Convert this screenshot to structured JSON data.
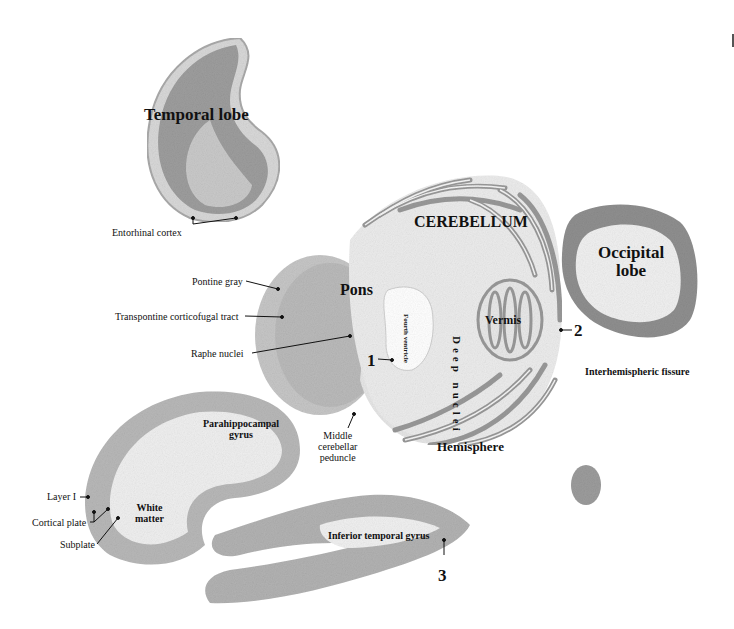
{
  "figure": {
    "structures": {
      "temporal_lobe": "Temporal lobe",
      "cerebellum": "CEREBELLUM",
      "occipital_lobe": [
        "Occipital",
        "lobe"
      ],
      "pons": "Pons",
      "vermis": "Vermis",
      "fourth_ventricle": [
        "Fourth",
        "ventricle"
      ],
      "deep_nuclei": "Deep nuclei",
      "hemisphere": "Hemisphere",
      "interhemispheric_fissure": "Interhemispheric fissure",
      "parahippocampal_gyrus": [
        "Parahippocampal",
        "gyrus"
      ],
      "white_matter": [
        "White",
        "matter"
      ],
      "inferior_temporal_gyrus": "Inferior temporal gyrus"
    },
    "callouts": {
      "entorhinal_cortex": "Entorhinal cortex",
      "pontine_gray": "Pontine gray",
      "transpontine_tract": "Transpontine corticofugal tract",
      "raphe_nuclei": "Raphe nuclei",
      "middle_cerebellar_peduncle": [
        "Middle",
        "cerebellar",
        "peduncle"
      ],
      "layer_i": "Layer I",
      "cortical_plate": "Cortical plate",
      "subplate": "Subplate"
    },
    "markers": [
      "1",
      "2",
      "3"
    ],
    "colors": {
      "tissue_dark": "#8f8f8f",
      "tissue_mid": "#b5b5b5",
      "tissue_light": "#dcdcdc",
      "white_matter": "#f2f2f2",
      "text": "#111111"
    }
  }
}
